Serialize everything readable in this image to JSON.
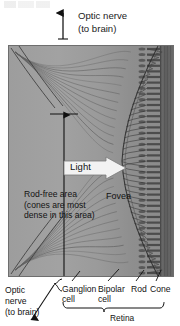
{
  "figure": {
    "title_remnant": ""
  },
  "top_callout": {
    "line1": "Optic nerve",
    "line2": "(to brain)",
    "arrow_icon": "up-arrow-icon"
  },
  "panel": {
    "light_arrow": {
      "label": "Light",
      "icon": "right-arrow-icon",
      "color": "#f2f2f2"
    },
    "rod_free": {
      "line1": "Rod-free area",
      "line2": "(cones are most",
      "line3": "dense in this area)"
    },
    "fovea_label": "Fovea",
    "measure_arrow_icon": "vertical-double-arrow-icon",
    "colors": {
      "vitreous_gray": "#9b9b9b",
      "pigment_band": "#5e5e5e",
      "border": "#6e6e6e",
      "ink": "#1b1b1b"
    }
  },
  "bottom_labels": {
    "optic_nerve": {
      "line1": "Optic",
      "line2": "nerve",
      "line3": "(to brain)",
      "arrow_icon": "down-left-arrow-icon",
      "brace_icon": "left-brace-icon"
    },
    "cells": [
      {
        "line1": "Ganglion",
        "line2": "cell"
      },
      {
        "line1": "Bipolar",
        "line2": "cell"
      },
      {
        "line1": "Rod",
        "line2": ""
      },
      {
        "line1": "Cone",
        "line2": ""
      }
    ],
    "retina": "Retina",
    "retina_brace_icon": "curly-brace-icon"
  }
}
